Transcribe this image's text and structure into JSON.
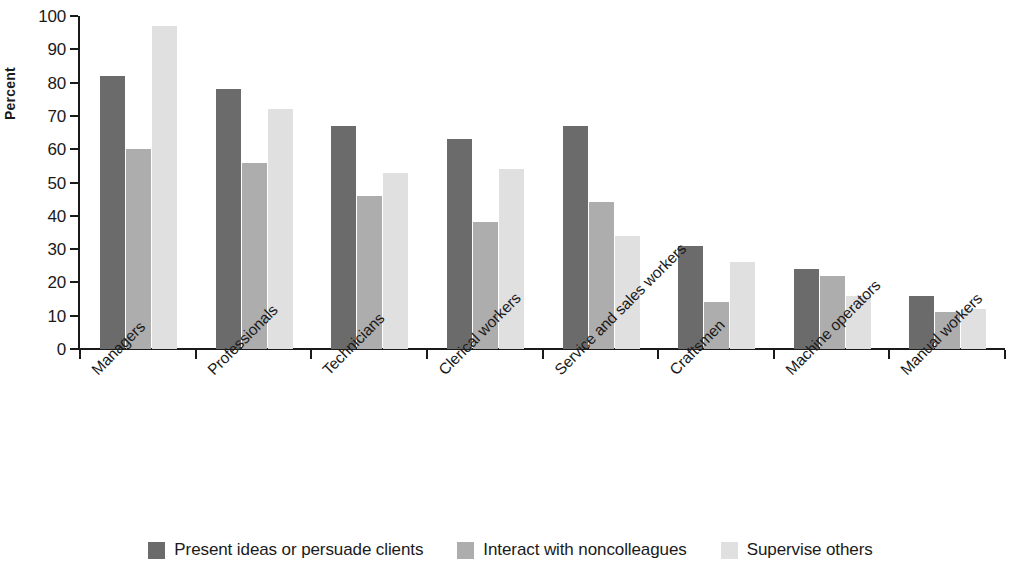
{
  "chart_data": {
    "type": "bar",
    "title": "",
    "subtitle": "",
    "xlabel": "",
    "ylabel": "Percent",
    "ylim": [
      0,
      100
    ],
    "y_ticks": [
      0,
      10,
      20,
      30,
      40,
      50,
      60,
      70,
      80,
      90,
      100
    ],
    "grid": false,
    "legend_position": "bottom",
    "categories": [
      "Managers",
      "Professionals",
      "Technicians",
      "Clerical workers",
      "Service and sales workers",
      "Craftsmen",
      "Machine operators",
      "Manual workers"
    ],
    "series": [
      {
        "name": "Present ideas or persuade clients",
        "color": "#6b6b6b",
        "values": [
          82,
          78,
          67,
          63,
          67,
          31,
          24,
          16
        ]
      },
      {
        "name": "Interact with noncolleagues",
        "color": "#adadad",
        "values": [
          60,
          56,
          46,
          38,
          44,
          14,
          22,
          11
        ]
      },
      {
        "name": "Supervise others",
        "color": "#e0e0e0",
        "values": [
          97,
          72,
          53,
          54,
          34,
          26,
          16,
          12
        ]
      }
    ]
  },
  "axis": {
    "y_title": "Percent"
  },
  "legend": {
    "items": [
      {
        "label": "Present ideas or persuade clients",
        "swatch": "s0"
      },
      {
        "label": "Interact with noncolleagues",
        "swatch": "s1"
      },
      {
        "label": "Supervise others",
        "swatch": "s2"
      }
    ]
  }
}
